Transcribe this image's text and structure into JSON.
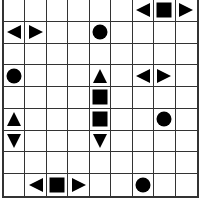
{
  "board": {
    "rows": 9,
    "cols": 9,
    "grid_color": "#333333",
    "piece_color": "#000000",
    "pieces": [
      {
        "row": 0,
        "col": 6,
        "shape": "left-triangle"
      },
      {
        "row": 0,
        "col": 7,
        "shape": "square"
      },
      {
        "row": 0,
        "col": 8,
        "shape": "right-triangle"
      },
      {
        "row": 1,
        "col": 0,
        "shape": "left-triangle"
      },
      {
        "row": 1,
        "col": 1,
        "shape": "right-triangle"
      },
      {
        "row": 1,
        "col": 4,
        "shape": "circle"
      },
      {
        "row": 3,
        "col": 0,
        "shape": "circle"
      },
      {
        "row": 3,
        "col": 4,
        "shape": "up-triangle"
      },
      {
        "row": 3,
        "col": 6,
        "shape": "left-triangle"
      },
      {
        "row": 3,
        "col": 7,
        "shape": "right-triangle"
      },
      {
        "row": 4,
        "col": 4,
        "shape": "square"
      },
      {
        "row": 5,
        "col": 0,
        "shape": "up-triangle"
      },
      {
        "row": 5,
        "col": 4,
        "shape": "square"
      },
      {
        "row": 5,
        "col": 7,
        "shape": "circle"
      },
      {
        "row": 6,
        "col": 0,
        "shape": "down-triangle"
      },
      {
        "row": 6,
        "col": 4,
        "shape": "down-triangle"
      },
      {
        "row": 8,
        "col": 1,
        "shape": "left-triangle"
      },
      {
        "row": 8,
        "col": 2,
        "shape": "square"
      },
      {
        "row": 8,
        "col": 3,
        "shape": "right-triangle"
      },
      {
        "row": 8,
        "col": 6,
        "shape": "circle"
      }
    ]
  }
}
